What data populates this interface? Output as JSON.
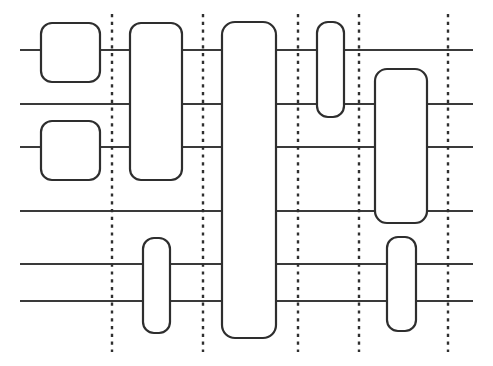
{
  "figure": {
    "kind": "quantum-circuit-diagram",
    "width": 493,
    "height": 366,
    "background_color": "#ffffff",
    "wire_color": "#3a3a3a",
    "gate_stroke_color": "#2e2e2e",
    "gate_fill_color": "#ffffff",
    "barrier_color": "#2f2f2f",
    "num_wires": 6,
    "num_gates": 8,
    "num_barriers": 5
  },
  "wires": [
    {
      "index": 1,
      "y": 50,
      "x_start": 20,
      "x_end": 473,
      "label": ""
    },
    {
      "index": 2,
      "y": 104,
      "x_start": 20,
      "x_end": 473,
      "label": ""
    },
    {
      "index": 3,
      "y": 147,
      "x_start": 20,
      "x_end": 473,
      "label": ""
    },
    {
      "index": 4,
      "y": 211,
      "x_start": 20,
      "x_end": 473,
      "label": ""
    },
    {
      "index": 5,
      "y": 264,
      "x_start": 20,
      "x_end": 473,
      "label": ""
    },
    {
      "index": 6,
      "y": 301,
      "x_start": 20,
      "x_end": 473,
      "label": ""
    }
  ],
  "barriers": [
    {
      "index": 1,
      "x": 112,
      "y_top": 14,
      "y_bottom": 352,
      "label": ""
    },
    {
      "index": 2,
      "x": 203,
      "y_top": 14,
      "y_bottom": 352,
      "label": ""
    },
    {
      "index": 3,
      "x": 298,
      "y_top": 14,
      "y_bottom": 352,
      "label": ""
    },
    {
      "index": 4,
      "x": 359,
      "y_top": 14,
      "y_bottom": 352,
      "label": ""
    },
    {
      "index": 5,
      "x": 448,
      "y_top": 14,
      "y_bottom": 352,
      "label": ""
    }
  ],
  "gates": [
    {
      "index": 1,
      "name": "gate-col1-wire1",
      "x": 41,
      "y": 23,
      "width": 59,
      "height": 59,
      "radius": 11,
      "wires": [
        1
      ],
      "label": ""
    },
    {
      "index": 2,
      "name": "gate-col1-wire3",
      "x": 41,
      "y": 121,
      "width": 59,
      "height": 59,
      "radius": 11,
      "wires": [
        3
      ],
      "label": ""
    },
    {
      "index": 3,
      "name": "gate-col2-wires1-3",
      "x": 130,
      "y": 23,
      "width": 52,
      "height": 157,
      "radius": 11,
      "wires": [
        1,
        2,
        3
      ],
      "label": ""
    },
    {
      "index": 4,
      "name": "gate-col2-wires5-6",
      "x": 143,
      "y": 238,
      "width": 27,
      "height": 95,
      "radius": 11,
      "wires": [
        5,
        6
      ],
      "label": ""
    },
    {
      "index": 5,
      "name": "gate-col3-all-wires",
      "x": 222,
      "y": 22,
      "width": 54,
      "height": 316,
      "radius": 13,
      "wires": [
        1,
        2,
        3,
        4,
        5,
        6
      ],
      "label": ""
    },
    {
      "index": 6,
      "name": "gate-col4-wires1-2",
      "x": 317,
      "y": 22,
      "width": 27,
      "height": 95,
      "radius": 11,
      "wires": [
        1,
        2
      ],
      "label": ""
    },
    {
      "index": 7,
      "name": "gate-col5-wires2-4",
      "x": 375,
      "y": 69,
      "width": 52,
      "height": 154,
      "radius": 12,
      "wires": [
        2,
        3,
        4
      ],
      "label": ""
    },
    {
      "index": 8,
      "name": "gate-col5-wires5-6",
      "x": 387,
      "y": 237,
      "width": 29,
      "height": 94,
      "radius": 11,
      "wires": [
        5,
        6
      ],
      "label": ""
    }
  ]
}
